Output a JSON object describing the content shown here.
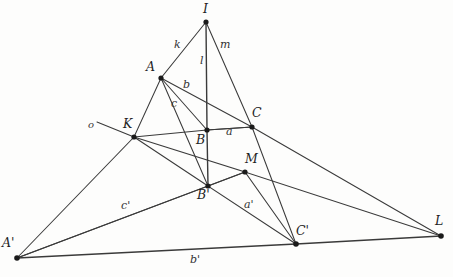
{
  "figure": {
    "kind": "geometry-diagram",
    "stroke_color": "#3a3a3a",
    "vertex_color": "#1a1a1a",
    "background_color": "#fdfdfc"
  },
  "points": [
    {
      "id": "I",
      "label": "I",
      "x": 206,
      "y": 22,
      "lx": 203,
      "ly": 4,
      "interactable": false
    },
    {
      "id": "A",
      "label": "A",
      "x": 161,
      "y": 78,
      "lx": 146,
      "ly": 62,
      "interactable": false
    },
    {
      "id": "K",
      "label": "K",
      "x": 134,
      "y": 137,
      "lx": 123,
      "ly": 119,
      "interactable": false
    },
    {
      "id": "B",
      "label": "B",
      "x": 207,
      "y": 130,
      "lx": 196,
      "ly": 135,
      "interactable": false
    },
    {
      "id": "C",
      "label": "C",
      "x": 252,
      "y": 127,
      "lx": 252,
      "ly": 108,
      "interactable": false
    },
    {
      "id": "M",
      "label": "M",
      "x": 245,
      "y": 172,
      "lx": 245,
      "ly": 154,
      "interactable": false
    },
    {
      "id": "Bp",
      "label": "B'",
      "x": 208,
      "y": 186,
      "lx": 198,
      "ly": 190,
      "interactable": false
    },
    {
      "id": "Ap",
      "label": "A'",
      "x": 17,
      "y": 258,
      "lx": 2,
      "ly": 238,
      "interactable": false
    },
    {
      "id": "Cp",
      "label": "C'",
      "x": 296,
      "y": 244,
      "lx": 296,
      "ly": 226,
      "interactable": false
    },
    {
      "id": "L",
      "label": "L",
      "x": 441,
      "y": 236,
      "lx": 436,
      "ly": 216,
      "interactable": false
    }
  ],
  "edges": [
    {
      "id": "I-A-K-Ap",
      "from": "I",
      "to": "Ap",
      "via": [
        "A",
        "K"
      ]
    },
    {
      "id": "I-B-Bp",
      "from": "I",
      "to": "Bp",
      "via": [
        "B"
      ]
    },
    {
      "id": "I-C-Cp",
      "from": "I",
      "to": "Cp",
      "via": [
        "C"
      ]
    },
    {
      "id": "A-B-C",
      "from": "A",
      "to": "C",
      "via": [
        "B"
      ]
    },
    {
      "id": "A-Bp-M-L",
      "from": "A",
      "to": "L",
      "via": [
        "M"
      ]
    },
    {
      "id": "A-Bp",
      "from": "A",
      "to": "Bp",
      "via": []
    },
    {
      "id": "K-B-C",
      "from": "K",
      "to": "C",
      "via": [
        "B"
      ]
    },
    {
      "id": "K-M-Cp",
      "from": "K",
      "to": "Cp",
      "via": [
        "M"
      ]
    },
    {
      "id": "K-Bp",
      "from": "K",
      "to": "Bp",
      "via": []
    },
    {
      "id": "Ap-Bp-Cp",
      "from": "Ap",
      "to": "Cp",
      "via": [
        "Bp"
      ]
    },
    {
      "id": "Ap-Cp-L",
      "from": "Ap",
      "to": "L",
      "via": [
        "Cp"
      ]
    },
    {
      "id": "Ap-M-L",
      "from": "Ap",
      "to": "L",
      "via": [
        "M"
      ]
    },
    {
      "id": "C-L",
      "from": "C",
      "to": "L",
      "via": []
    },
    {
      "id": "Bp-Cp",
      "from": "Bp",
      "to": "Cp",
      "via": []
    },
    {
      "id": "o-ray",
      "from": "o",
      "to": "K",
      "via": []
    }
  ],
  "segment_labels": [
    {
      "id": "k",
      "text": "k",
      "x": 176,
      "y": 44,
      "interactable": false
    },
    {
      "id": "l",
      "text": "l",
      "x": 201,
      "y": 60,
      "interactable": false
    },
    {
      "id": "m",
      "text": "m",
      "x": 222,
      "y": 44,
      "interactable": false
    },
    {
      "id": "b",
      "text": "b",
      "x": 185,
      "y": 84,
      "interactable": false
    },
    {
      "id": "c",
      "text": "c",
      "x": 173,
      "y": 103,
      "interactable": false
    },
    {
      "id": "a",
      "text": "a",
      "x": 227,
      "y": 131,
      "interactable": false
    },
    {
      "id": "o",
      "text": "o",
      "x": 90,
      "y": 125,
      "interactable": false
    },
    {
      "id": "cp",
      "text": "c'",
      "x": 124,
      "y": 205,
      "interactable": false
    },
    {
      "id": "ap",
      "text": "a'",
      "x": 246,
      "y": 204,
      "interactable": false
    },
    {
      "id": "bp",
      "text": "b'",
      "x": 192,
      "y": 259,
      "interactable": false
    }
  ]
}
